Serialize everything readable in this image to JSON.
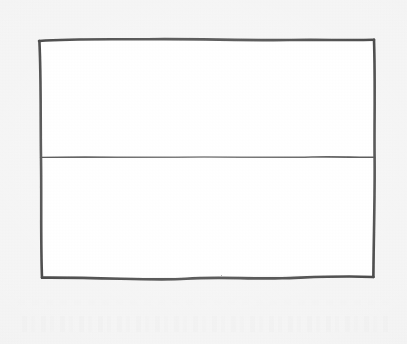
{
  "image": {
    "kind": "hand-drawn-sketch",
    "medium": "pencil-on-paper-scan",
    "width": 407,
    "height": 344,
    "description": "Hand-drawn rectangle divided into two empty horizontal panels by a single horizontal line",
    "visible_text": "",
    "colors": {
      "paper_background": "#f3f3f3",
      "shape_fill": "#ffffff",
      "ink_stroke": "#2a2a2a",
      "ghost_artifact": "#fbfbfb"
    }
  },
  "figure": {
    "name": "divided-rectangle",
    "label": "",
    "outer_rect": {
      "name": "outer-rectangle",
      "left": 39,
      "top": 39,
      "right": 374,
      "bottom": 277,
      "stroke_width": 2.6,
      "fill": "#ffffff"
    },
    "divider": {
      "name": "horizontal-divider",
      "y": 157,
      "x_start": 39,
      "x_end": 374,
      "stroke_width": 1.6,
      "orientation": "horizontal"
    },
    "panels": [
      {
        "name": "upper-panel",
        "label": "",
        "content": ""
      },
      {
        "name": "lower-panel",
        "label": "",
        "content": ""
      }
    ]
  },
  "artifacts": {
    "ghost_band": {
      "name": "scan-ghost-band",
      "label": "",
      "note": ""
    }
  }
}
